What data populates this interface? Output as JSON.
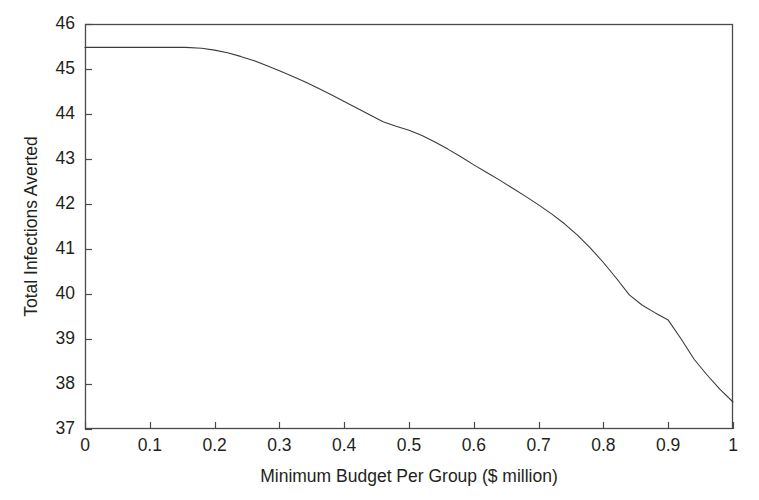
{
  "chart_data": {
    "type": "line",
    "title": "",
    "subtitle": "",
    "xlabel": "Minimum Budget Per Group ($ million)",
    "ylabel": "Total Infections Averted",
    "xlim": [
      0,
      1
    ],
    "ylim": [
      37,
      46
    ],
    "xticks": [
      "0",
      "0.1",
      "0.2",
      "0.3",
      "0.4",
      "0.5",
      "0.6",
      "0.7",
      "0.8",
      "0.9",
      "1"
    ],
    "xtick_values": [
      0,
      0.1,
      0.2,
      0.3,
      0.4,
      0.5,
      0.6,
      0.7,
      0.8,
      0.9,
      1
    ],
    "yticks": [
      "37",
      "38",
      "39",
      "40",
      "41",
      "42",
      "43",
      "44",
      "45",
      "46"
    ],
    "ytick_values": [
      37,
      38,
      39,
      40,
      41,
      42,
      43,
      44,
      45,
      46
    ],
    "grid": false,
    "legend": null,
    "legend_position": "none",
    "frame": "box",
    "line_color": "#3b3b3b",
    "line_width": 1.1,
    "background": "#ffffff",
    "annotations": [],
    "series": [
      {
        "name": "Total Infections Averted",
        "x": [
          0.0,
          0.02,
          0.04,
          0.06,
          0.08,
          0.1,
          0.12,
          0.14,
          0.155,
          0.18,
          0.2,
          0.22,
          0.24,
          0.26,
          0.28,
          0.3,
          0.32,
          0.34,
          0.36,
          0.38,
          0.4,
          0.42,
          0.44,
          0.46,
          0.48,
          0.5,
          0.52,
          0.54,
          0.56,
          0.58,
          0.6,
          0.62,
          0.64,
          0.66,
          0.68,
          0.7,
          0.72,
          0.74,
          0.76,
          0.78,
          0.8,
          0.82,
          0.84,
          0.86,
          0.88,
          0.9,
          0.92,
          0.94,
          0.96,
          0.98,
          1.0
        ],
        "y": [
          45.48,
          45.48,
          45.48,
          45.48,
          45.48,
          45.48,
          45.48,
          45.48,
          45.48,
          45.46,
          45.42,
          45.36,
          45.28,
          45.19,
          45.08,
          44.96,
          44.84,
          44.71,
          44.57,
          44.43,
          44.28,
          44.13,
          43.98,
          43.83,
          43.73,
          43.64,
          43.52,
          43.38,
          43.22,
          43.05,
          42.87,
          42.7,
          42.53,
          42.35,
          42.17,
          41.98,
          41.78,
          41.56,
          41.31,
          41.02,
          40.7,
          40.35,
          39.98,
          39.75,
          39.58,
          39.42,
          39.0,
          38.55,
          38.2,
          37.88,
          37.6
        ]
      }
    ]
  },
  "axes": {
    "y_title": "Total Infections Averted",
    "x_title": "Minimum Budget Per Group ($ million)"
  }
}
